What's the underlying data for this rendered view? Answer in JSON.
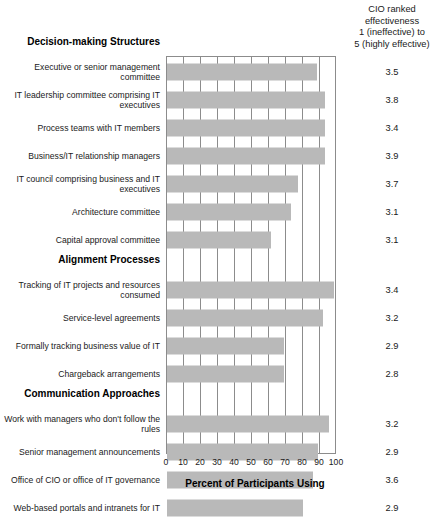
{
  "header": {
    "lines": [
      "CIO ranked",
      "effectiveness",
      "1 (ineffective) to",
      "5 (highly effective)"
    ]
  },
  "axis": {
    "title": "Percent of Participants Using",
    "ticks": [
      "0",
      "10",
      "20",
      "30",
      "40",
      "50",
      "60",
      "70",
      "80",
      "90",
      "100"
    ]
  },
  "chart_data": {
    "type": "bar",
    "orientation": "horizontal",
    "title": "",
    "xlabel": "Percent of Participants Using",
    "ylabel": "",
    "xlim": [
      0,
      100
    ],
    "grid": true,
    "legend": null,
    "bar_color": "#b9b9b9",
    "value_column_header": "CIO ranked effectiveness 1 (ineffective) to 5 (highly effective)",
    "groups": [
      {
        "name": "Decision-making Structures",
        "items": [
          {
            "label": "Executive or senior management committee",
            "percent": 88,
            "rank": "3.5"
          },
          {
            "label": "IT leadership committee comprising IT executives",
            "percent": 93,
            "rank": "3.8"
          },
          {
            "label": "Process teams with IT members",
            "percent": 93,
            "rank": "3.4"
          },
          {
            "label": "Business/IT relationship managers",
            "percent": 93,
            "rank": "3.9"
          },
          {
            "label": "IT council comprising business and IT executives",
            "percent": 77,
            "rank": "3.7"
          },
          {
            "label": "Architecture committee",
            "percent": 73,
            "rank": "3.1"
          },
          {
            "label": "Capital approval committee",
            "percent": 61,
            "rank": "3.1"
          }
        ]
      },
      {
        "name": "Alignment Processes",
        "items": [
          {
            "label": "Tracking of IT projects and resources consumed",
            "percent": 98,
            "rank": "3.4"
          },
          {
            "label": "Service-level agreements",
            "percent": 92,
            "rank": "3.2"
          },
          {
            "label": "Formally tracking business value of IT",
            "percent": 69,
            "rank": "2.9"
          },
          {
            "label": "Chargeback arrangements",
            "percent": 69,
            "rank": "2.8"
          }
        ]
      },
      {
        "name": "Communication Approaches",
        "items": [
          {
            "label": "Work with managers who don't follow the rules",
            "percent": 95,
            "rank": "3.2"
          },
          {
            "label": "Senior management announcements",
            "percent": 89,
            "rank": "2.9"
          },
          {
            "label": "Office of CIO or office of IT governance",
            "percent": 86,
            "rank": "3.6"
          },
          {
            "label": "Web-based portals and intranets for IT",
            "percent": 80,
            "rank": "2.9"
          }
        ]
      }
    ]
  }
}
